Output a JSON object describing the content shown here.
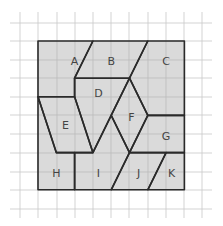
{
  "diagram": {
    "grid": {
      "cols": 11,
      "rows": 11,
      "x_lines": [
        20,
        38,
        57,
        75,
        93,
        111,
        129,
        148,
        166,
        184,
        202
      ],
      "y_lines": [
        23,
        41,
        60,
        78,
        97,
        115,
        134,
        153,
        172,
        190,
        209
      ],
      "line_color": "#c8c8c8"
    },
    "square": {
      "origin_px": [
        38,
        41
      ],
      "unit_px": [
        18.3,
        18.6
      ],
      "size_units": 8,
      "fill": "#d4d4d4",
      "stroke": "#2a2a2a"
    },
    "pieces": [
      {
        "label": "A",
        "label_pos": [
          2,
          1.1
        ],
        "vertices": [
          [
            0,
            0
          ],
          [
            3,
            0
          ],
          [
            2,
            2
          ],
          [
            2,
            3
          ],
          [
            0,
            3
          ]
        ]
      },
      {
        "label": "B",
        "label_pos": [
          4,
          1.1
        ],
        "vertices": [
          [
            3,
            0
          ],
          [
            6,
            0
          ],
          [
            5,
            2
          ],
          [
            2,
            2
          ]
        ]
      },
      {
        "label": "C",
        "label_pos": [
          7,
          1.1
        ],
        "vertices": [
          [
            6,
            0
          ],
          [
            8,
            0
          ],
          [
            8,
            4
          ],
          [
            6,
            4
          ],
          [
            5,
            2
          ]
        ]
      },
      {
        "label": "D",
        "label_pos": [
          3.3,
          2.8
        ],
        "vertices": [
          [
            2,
            2
          ],
          [
            5,
            2
          ],
          [
            4,
            4
          ],
          [
            3,
            6
          ],
          [
            2,
            3
          ]
        ]
      },
      {
        "label": "E",
        "label_pos": [
          1.5,
          4.5
        ],
        "vertices": [
          [
            0,
            3
          ],
          [
            2,
            3
          ],
          [
            3,
            6
          ],
          [
            1,
            6
          ]
        ]
      },
      {
        "label": "F",
        "label_pos": [
          5.1,
          4.1
        ],
        "vertices": [
          [
            5,
            2
          ],
          [
            6,
            4
          ],
          [
            5,
            6
          ],
          [
            4,
            4
          ]
        ]
      },
      {
        "label": "G",
        "label_pos": [
          7,
          5.1
        ],
        "vertices": [
          [
            6,
            4
          ],
          [
            8,
            4
          ],
          [
            8,
            6
          ],
          [
            5,
            6
          ]
        ]
      },
      {
        "label": "H",
        "label_pos": [
          1,
          7.1
        ],
        "vertices": [
          [
            0,
            3
          ],
          [
            1,
            6
          ],
          [
            2,
            6
          ],
          [
            2,
            8
          ],
          [
            0,
            8
          ]
        ]
      },
      {
        "label": "I",
        "label_pos": [
          3.3,
          7.1
        ],
        "vertices": [
          [
            2,
            6
          ],
          [
            3,
            6
          ],
          [
            4,
            4
          ],
          [
            5,
            6
          ],
          [
            4,
            8
          ],
          [
            2,
            8
          ]
        ]
      },
      {
        "label": "J",
        "label_pos": [
          5.5,
          7.1
        ],
        "vertices": [
          [
            5,
            6
          ],
          [
            7,
            6
          ],
          [
            6,
            8
          ],
          [
            4,
            8
          ]
        ]
      },
      {
        "label": "K",
        "label_pos": [
          7.3,
          7.1
        ],
        "vertices": [
          [
            7,
            6
          ],
          [
            8,
            6
          ],
          [
            8,
            8
          ],
          [
            6,
            8
          ]
        ]
      }
    ]
  }
}
